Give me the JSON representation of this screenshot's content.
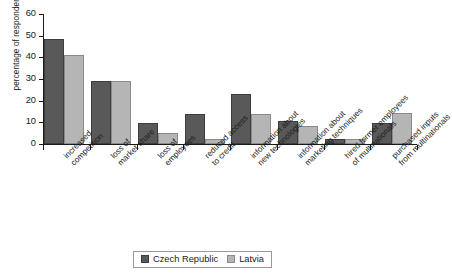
{
  "chart_data": {
    "type": "bar",
    "title": "",
    "subtitle": "",
    "xlabel": "",
    "ylabel": "percentage of respondents",
    "ylim": [
      0,
      60
    ],
    "yticks": [
      0,
      10,
      20,
      30,
      40,
      50,
      60
    ],
    "grid": false,
    "legend_position": "bottom-center",
    "categories": [
      "increased\ncompetition",
      "loss of\nmarket share",
      "loss of\nemployees",
      "reduced access\nto credit",
      "information about\nnew technologies",
      "information about\nmarketing techniques",
      "hired former employees\nof multinationals",
      "purchased inputs\nfrom multinationals"
    ],
    "series": [
      {
        "name": "Czech Republic",
        "color": "#595959",
        "values": [
          48.5,
          29.3,
          9.7,
          14.0,
          23.3,
          10.5,
          2.4,
          9.7
        ]
      },
      {
        "name": "Latvia",
        "color": "#b5b5b5",
        "values": [
          41.0,
          29.0,
          5.2,
          2.5,
          13.8,
          8.2,
          2.3,
          14.3
        ]
      }
    ]
  },
  "axis": {
    "y_title": "percentage of respondents"
  }
}
